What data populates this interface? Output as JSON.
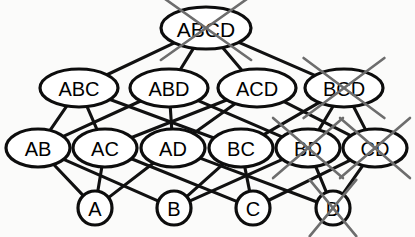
{
  "diagram": {
    "type": "hasse-lattice",
    "colors": {
      "background": "#fbfbfa",
      "node_fill": "#ffffff",
      "node_stroke": "#0d0d0d",
      "edge_stroke": "#111111",
      "cross_stroke": "#6d6d6d"
    },
    "nodes": [
      {
        "id": "ABCD",
        "label": "ABCD",
        "level": 4,
        "cx": 206,
        "cy": 28,
        "rx": 45,
        "ry": 21,
        "shape": "ellipse",
        "font_size": 21,
        "crossed_out": true
      },
      {
        "id": "ABC",
        "label": "ABC",
        "level": 3,
        "cx": 79,
        "cy": 88,
        "rx": 39,
        "ry": 19,
        "shape": "ellipse",
        "font_size": 20,
        "crossed_out": false
      },
      {
        "id": "ABD",
        "label": "ABD",
        "level": 3,
        "cx": 169,
        "cy": 88,
        "rx": 39,
        "ry": 19,
        "shape": "ellipse",
        "font_size": 20,
        "crossed_out": false
      },
      {
        "id": "ACD",
        "label": "ACD",
        "level": 3,
        "cx": 257,
        "cy": 88,
        "rx": 39,
        "ry": 19,
        "shape": "ellipse",
        "font_size": 20,
        "crossed_out": false
      },
      {
        "id": "BCD",
        "label": "BCD",
        "level": 3,
        "cx": 344,
        "cy": 88,
        "rx": 39,
        "ry": 19,
        "shape": "ellipse",
        "font_size": 20,
        "crossed_out": true
      },
      {
        "id": "AB",
        "label": "AB",
        "level": 2,
        "cx": 38,
        "cy": 148,
        "rx": 32,
        "ry": 19,
        "shape": "ellipse",
        "font_size": 20,
        "crossed_out": false
      },
      {
        "id": "AC",
        "label": "AC",
        "level": 2,
        "cx": 105,
        "cy": 148,
        "rx": 32,
        "ry": 19,
        "shape": "ellipse",
        "font_size": 20,
        "crossed_out": false
      },
      {
        "id": "AD",
        "label": "AD",
        "level": 2,
        "cx": 173,
        "cy": 148,
        "rx": 32,
        "ry": 19,
        "shape": "ellipse",
        "font_size": 20,
        "crossed_out": false
      },
      {
        "id": "BC",
        "label": "BC",
        "level": 2,
        "cx": 241,
        "cy": 148,
        "rx": 32,
        "ry": 19,
        "shape": "ellipse",
        "font_size": 20,
        "crossed_out": false
      },
      {
        "id": "BD",
        "label": "BD",
        "level": 2,
        "cx": 308,
        "cy": 148,
        "rx": 32,
        "ry": 19,
        "shape": "ellipse",
        "font_size": 20,
        "crossed_out": true
      },
      {
        "id": "CD",
        "label": "CD",
        "level": 2,
        "cx": 375,
        "cy": 148,
        "rx": 32,
        "ry": 19,
        "shape": "ellipse",
        "font_size": 20,
        "crossed_out": true
      },
      {
        "id": "A",
        "label": "A",
        "level": 1,
        "cx": 95,
        "cy": 208,
        "rx": 17,
        "ry": 17,
        "shape": "circle",
        "font_size": 20,
        "crossed_out": false
      },
      {
        "id": "B",
        "label": "B",
        "level": 1,
        "cx": 174,
        "cy": 208,
        "rx": 17,
        "ry": 17,
        "shape": "circle",
        "font_size": 20,
        "crossed_out": false
      },
      {
        "id": "C",
        "label": "C",
        "level": 1,
        "cx": 253,
        "cy": 208,
        "rx": 17,
        "ry": 17,
        "shape": "circle",
        "font_size": 20,
        "crossed_out": false
      },
      {
        "id": "D",
        "label": "D",
        "level": 1,
        "cx": 333,
        "cy": 208,
        "rx": 17,
        "ry": 17,
        "shape": "circle",
        "font_size": 20,
        "crossed_out": true
      }
    ],
    "edges": [
      {
        "from": "ABCD",
        "to": "ABC"
      },
      {
        "from": "ABCD",
        "to": "ABD"
      },
      {
        "from": "ABCD",
        "to": "ACD"
      },
      {
        "from": "ABCD",
        "to": "BCD"
      },
      {
        "from": "ABC",
        "to": "AB"
      },
      {
        "from": "ABC",
        "to": "AC"
      },
      {
        "from": "ABC",
        "to": "BC"
      },
      {
        "from": "ABD",
        "to": "AB"
      },
      {
        "from": "ABD",
        "to": "AD"
      },
      {
        "from": "ABD",
        "to": "BD"
      },
      {
        "from": "ACD",
        "to": "AC"
      },
      {
        "from": "ACD",
        "to": "AD"
      },
      {
        "from": "ACD",
        "to": "CD"
      },
      {
        "from": "BCD",
        "to": "BC"
      },
      {
        "from": "BCD",
        "to": "BD"
      },
      {
        "from": "BCD",
        "to": "CD"
      },
      {
        "from": "AB",
        "to": "A"
      },
      {
        "from": "AB",
        "to": "B"
      },
      {
        "from": "AC",
        "to": "A"
      },
      {
        "from": "AC",
        "to": "C"
      },
      {
        "from": "AD",
        "to": "A"
      },
      {
        "from": "AD",
        "to": "D"
      },
      {
        "from": "BC",
        "to": "B"
      },
      {
        "from": "BC",
        "to": "C"
      },
      {
        "from": "BD",
        "to": "B"
      },
      {
        "from": "BD",
        "to": "D"
      },
      {
        "from": "CD",
        "to": "C"
      },
      {
        "from": "CD",
        "to": "D"
      }
    ]
  }
}
